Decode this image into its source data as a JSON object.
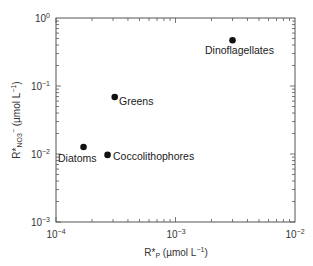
{
  "chart_data": {
    "type": "scatter",
    "title": "",
    "xlabel": "R*P (µmol L−1)",
    "ylabel": "R*NO3− (µmol L−1)",
    "xscale": "log",
    "yscale": "log",
    "xlim": [
      0.0001,
      0.01
    ],
    "ylim": [
      0.001,
      1
    ],
    "x_ticks": [
      "10^-4",
      "10^-3",
      "10^-2"
    ],
    "y_ticks": [
      "10^-3",
      "10^-2",
      "10^-1",
      "10^0"
    ],
    "grid": false,
    "legend": null,
    "points": [
      {
        "label": "Diatoms",
        "x": 0.00017,
        "y": 0.0127
      },
      {
        "label": "Coccolithophores",
        "x": 0.00027,
        "y": 0.0097
      },
      {
        "label": "Greens",
        "x": 0.00031,
        "y": 0.069
      },
      {
        "label": "Dinoflagellates",
        "x": 0.003,
        "y": 0.47
      }
    ]
  },
  "axes": {
    "x": {
      "title_main": "R*",
      "title_sub": "P",
      "title_unit": " (µmol L",
      "title_exp": "−1",
      "title_close": ")",
      "ticks": [
        {
          "base": "10",
          "exp": "−4"
        },
        {
          "base": "10",
          "exp": "−3"
        },
        {
          "base": "10",
          "exp": "−2"
        }
      ]
    },
    "y": {
      "title_main": "R*",
      "title_sub": "NO3",
      "title_sup": "−",
      "title_unit": " (µmol L",
      "title_exp": "−1",
      "title_close": ")",
      "ticks": [
        {
          "base": "10",
          "exp": "0"
        },
        {
          "base": "10",
          "exp": "−1"
        },
        {
          "base": "10",
          "exp": "−2"
        },
        {
          "base": "10",
          "exp": "−3"
        }
      ]
    }
  },
  "labels": {
    "diatoms": "Diatoms",
    "coccolithophores": "Coccolithophores",
    "greens": "Greens",
    "dinoflagellates": "Dinoflagellates"
  }
}
